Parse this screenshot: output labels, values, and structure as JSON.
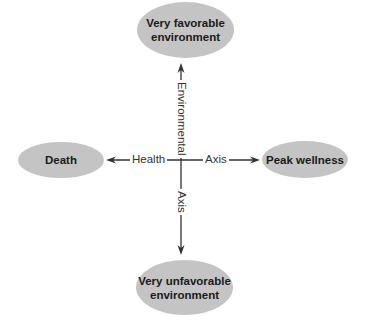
{
  "diagram": {
    "nodes": {
      "top": {
        "line1": "Very favorable",
        "line2": "environment"
      },
      "bottom": {
        "line1": "Very unfavorable",
        "line2": "environment"
      },
      "left": {
        "label": "Death"
      },
      "right": {
        "label": "Peak wellness"
      }
    },
    "axes": {
      "horizontal": {
        "left_label": "Health",
        "right_label": "Axis"
      },
      "vertical": {
        "top_label": "Environmental",
        "bottom_label": "Axis"
      }
    },
    "colors": {
      "node_fill": "#c4c4c4",
      "line": "#333333",
      "text": "#1a1a1a"
    }
  }
}
